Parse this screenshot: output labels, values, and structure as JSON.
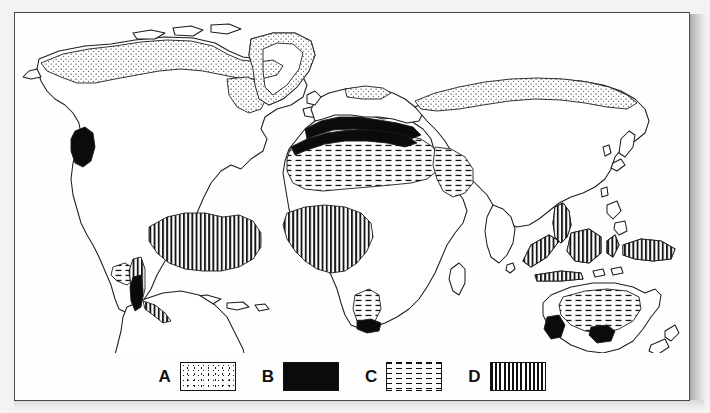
{
  "figure": {
    "type": "thematic-world-map",
    "title": "",
    "background_color": "#f3f3f1",
    "sheet_color": "#fefefe",
    "border_color": "#4a4a4a",
    "ink_color": "#111111"
  },
  "legend": {
    "position": "bottom-center",
    "items": [
      {
        "letter": "A",
        "pattern": "stipple-dots",
        "swatch_class": "sw-stipple",
        "swatch_name": "legend-swatch-stipple"
      },
      {
        "letter": "B",
        "pattern": "solid-black",
        "swatch_class": "sw-solid",
        "swatch_name": "legend-swatch-solid"
      },
      {
        "letter": "C",
        "pattern": "horizontal-dashes",
        "swatch_class": "sw-dash",
        "swatch_name": "legend-swatch-dash"
      },
      {
        "letter": "D",
        "pattern": "vertical-lines",
        "swatch_class": "sw-vert",
        "swatch_name": "legend-swatch-vertical"
      }
    ]
  },
  "map_regions": {
    "stipple_A": [
      "northern Canada and Arctic archipelago",
      "Alaska north coast",
      "Greenland coastal fringe",
      "northern Scandinavia",
      "northern Siberia / Russian Arctic coast"
    ],
    "solid_B": [
      "California coast (North America west)",
      "central Chile coast (South America west)",
      "Mediterranean basin north and south shores",
      "South Africa Cape coast",
      "southwest Australia",
      "south Australia coast"
    ],
    "dashes_C": [
      "Sahara, North Africa",
      "Arabian peninsula",
      "Namib / Kalahari, southern Africa",
      "Australian interior desert",
      "Baja California / northern Mexico"
    ],
    "vertical_D": [
      "Amazon basin, South America",
      "West and Central Africa (Congo basin)",
      "Malay peninsula / Sumatra / Borneo / Java",
      "New Guinea and Melanesia",
      "southern Mexico"
    ]
  }
}
